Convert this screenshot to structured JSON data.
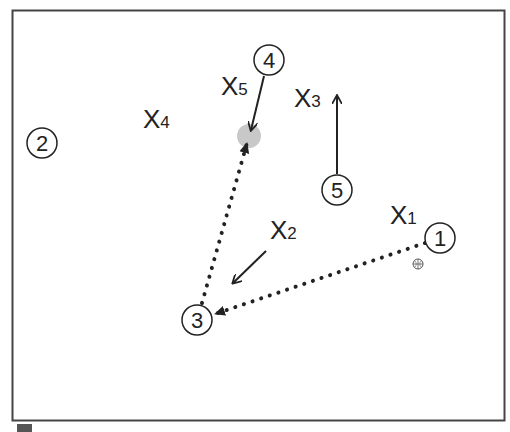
{
  "diagram": {
    "type": "play-diagram",
    "players": [
      {
        "id": "1",
        "label": "1",
        "x": 440,
        "y": 238
      },
      {
        "id": "2",
        "label": "2",
        "x": 42,
        "y": 143
      },
      {
        "id": "3",
        "label": "3",
        "x": 197,
        "y": 320
      },
      {
        "id": "4",
        "label": "4",
        "x": 269,
        "y": 60
      },
      {
        "id": "5",
        "label": "5",
        "x": 337,
        "y": 190
      }
    ],
    "defenders": [
      {
        "id": "X1",
        "main": "X",
        "sub": "1",
        "x": 390,
        "y": 224
      },
      {
        "id": "X2",
        "main": "X",
        "sub": "2",
        "x": 270,
        "y": 239
      },
      {
        "id": "X3",
        "main": "X",
        "sub": "3",
        "x": 294,
        "y": 107
      },
      {
        "id": "X4",
        "main": "X",
        "sub": "4",
        "x": 143,
        "y": 126
      },
      {
        "id": "X5",
        "main": "X",
        "sub": "5",
        "x": 221,
        "y": 94
      }
    ],
    "ball_icon": "basketball-icon",
    "target_spot_color": "#c8c8c8",
    "frame_color": "#333333"
  }
}
